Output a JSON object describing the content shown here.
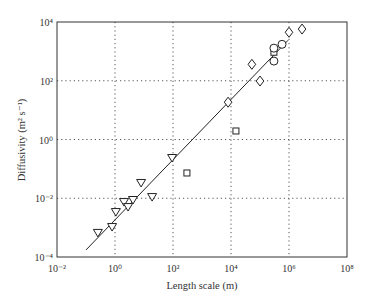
{
  "chart_data": {
    "type": "scatter",
    "title": "",
    "xlabel": "Length scale (m)",
    "ylabel": "Diffusivity (m² s⁻¹)",
    "xscale": "log",
    "yscale": "log",
    "xlim": [
      0.01,
      100000000
    ],
    "ylim": [
      0.0001,
      10000
    ],
    "grid": true,
    "x_ticks": [
      "10⁻²",
      "10⁰",
      "10²",
      "10⁴",
      "10⁶",
      "10⁸"
    ],
    "y_ticks": [
      "10⁻⁴",
      "10⁻²",
      "10⁰",
      "10²",
      "10⁴"
    ],
    "series": [
      {
        "name": "triangles",
        "marker": "triangle-down",
        "log10_points": [
          [
            -0.59,
            -3.18
          ],
          [
            -0.1,
            -2.98
          ],
          [
            0.03,
            -2.47
          ],
          [
            0.31,
            -2.13
          ],
          [
            0.45,
            -2.3
          ],
          [
            0.62,
            -2.06
          ],
          [
            0.9,
            -1.48
          ],
          [
            1.28,
            -1.96
          ],
          [
            1.97,
            -0.63
          ]
        ],
        "points": [
          [
            0.26,
            0.00066
          ],
          [
            0.79,
            0.00105
          ],
          [
            1.07,
            0.0034
          ],
          [
            2.0,
            0.0074
          ],
          [
            2.8,
            0.005
          ],
          [
            4.2,
            0.0087
          ],
          [
            7.9,
            0.033
          ],
          [
            19,
            0.011
          ],
          [
            93,
            0.23
          ]
        ]
      },
      {
        "name": "squares",
        "marker": "square",
        "log10_points": [
          [
            2.48,
            -1.14
          ],
          [
            4.17,
            0.29
          ],
          [
            5.48,
            2.97
          ]
        ],
        "points": [
          [
            300,
            0.072
          ],
          [
            15000,
            1.95
          ],
          [
            300000,
            930
          ]
        ]
      },
      {
        "name": "diamonds",
        "marker": "diamond",
        "log10_points": [
          [
            3.9,
            1.27
          ],
          [
            4.72,
            2.56
          ],
          [
            5.0,
            1.99
          ],
          [
            6.0,
            3.65
          ],
          [
            6.45,
            3.76
          ]
        ],
        "points": [
          [
            8000,
            19
          ],
          [
            52000,
            360
          ],
          [
            100000,
            98
          ],
          [
            1000000,
            4500
          ],
          [
            2800000,
            5800
          ]
        ]
      },
      {
        "name": "circles",
        "marker": "circle",
        "log10_points": [
          [
            5.48,
            3.11
          ],
          [
            5.48,
            2.67
          ],
          [
            5.76,
            3.24
          ]
        ],
        "points": [
          [
            300000,
            1300
          ],
          [
            300000,
            470
          ],
          [
            580000,
            1740
          ]
        ]
      }
    ],
    "fit_line": {
      "log10_start": [
        -1.0,
        -3.76
      ],
      "log10_end": [
        5.97,
        3.38
      ]
    }
  }
}
